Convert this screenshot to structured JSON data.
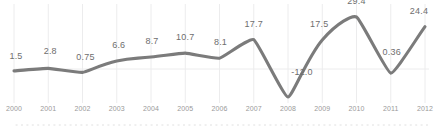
{
  "chart_data": {
    "type": "line",
    "title": "",
    "subtitle": "",
    "xlabel": "",
    "ylabel": "",
    "grid": true,
    "legend": false,
    "categories": [
      "2000",
      "2001",
      "2002",
      "2003",
      "2004",
      "2005",
      "2006",
      "2007",
      "2008",
      "2009",
      "2010",
      "2011",
      "2012"
    ],
    "values": [
      1.5,
      2.8,
      0.75,
      6.6,
      8.7,
      10.7,
      8.1,
      17.7,
      -12.0,
      17.5,
      29.4,
      0.36,
      24.4
    ],
    "value_labels": [
      "1.5",
      "2.8",
      "0.75",
      "6.6",
      "8.7",
      "10.7",
      "8.1",
      "17.7",
      "-12.0",
      "17.5",
      "29.4",
      "0.36",
      "24.4"
    ],
    "tick_labels": [
      "2000",
      "2001",
      "2002",
      "2003",
      "2004",
      "2005",
      "2006",
      "2007",
      "2008",
      "2009",
      "2010",
      "2011",
      "2012"
    ],
    "ylim": [
      -12.0,
      29.4
    ],
    "xlim": [
      "2000",
      "2012"
    ],
    "series": [
      {
        "name": "",
        "values": [
          1.5,
          2.8,
          0.75,
          6.6,
          8.7,
          10.7,
          8.1,
          17.7,
          -12.0,
          17.5,
          29.4,
          0.36,
          24.4
        ],
        "color": "#7b7b7b"
      }
    ],
    "colors": {
      "line": "#7b7b7b",
      "gridline": "#ececed",
      "baseline": "#e8e8e9",
      "value_label": "#6e6e6e",
      "tick_label": "#9a9a9a",
      "dotted_rule": "#e0e0e0",
      "background": "#ffffff"
    }
  }
}
